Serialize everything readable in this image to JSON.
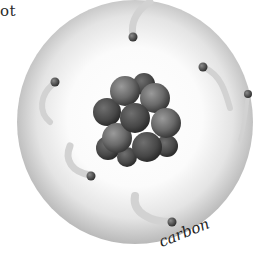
{
  "image": {
    "subject": "carbon atom illustration",
    "partial_text_top_left": "ot",
    "caption": "carbon",
    "electron_count": 6,
    "colors": {
      "shell_outer": "#bdbdbd",
      "shell_inner": "#ffffff",
      "nucleus_dark": "#3c3c3c",
      "nucleus_light": "#8e8e8e",
      "electron": "#4a4a4a",
      "caption_text": "#1e1e1e"
    }
  }
}
